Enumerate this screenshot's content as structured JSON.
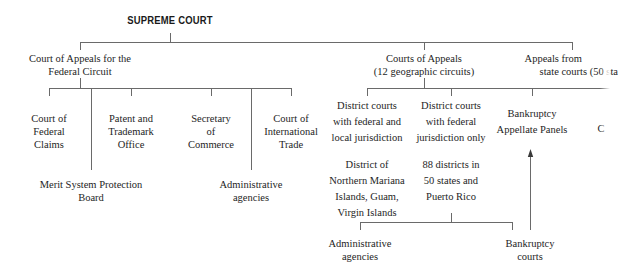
{
  "diagram": {
    "root": {
      "label": "SUPREME COURT"
    },
    "level1": [
      {
        "id": "cafc",
        "lines": [
          "Court of Appeals for the",
          "Federal Circuit"
        ]
      },
      {
        "id": "coa",
        "lines": [
          "Courts of Appeals",
          "(12 geographic circuits)"
        ]
      },
      {
        "id": "state",
        "lines": [
          "Appeals from",
          "state courts (50 sta"
        ]
      }
    ],
    "cafc_children": [
      {
        "id": "federal-claims",
        "lines": [
          "Court of",
          "Federal",
          "Claims"
        ]
      },
      {
        "id": "patent-trademark",
        "lines": [
          "Patent and",
          "Trademark",
          "Office"
        ]
      },
      {
        "id": "secretary-commerce",
        "lines": [
          "Secretary",
          "of",
          "Commerce"
        ]
      },
      {
        "id": "international-trade",
        "lines": [
          "Court of",
          "International",
          "Trade"
        ]
      },
      {
        "id": "merit-system",
        "lines": [
          "Merit System Protection",
          "Board"
        ]
      },
      {
        "id": "admin-agencies-left",
        "lines": [
          "Administrative",
          "agencies"
        ]
      }
    ],
    "coa_children": [
      {
        "id": "district-federal-local",
        "lines": [
          "District courts",
          "with federal and",
          "local jurisdiction"
        ]
      },
      {
        "id": "district-federal-only",
        "lines": [
          "District courts",
          "with federal",
          "jurisdiction only"
        ]
      },
      {
        "id": "bankruptcy-panels",
        "lines": [
          "Bankruptcy",
          "Appellate Panels"
        ]
      },
      {
        "id": "cut-off",
        "lines": [
          "C"
        ]
      }
    ],
    "district_details": [
      {
        "id": "territories",
        "lines": [
          "District of",
          "Northern Mariana",
          "Islands, Guam,",
          "Virgin Islands"
        ]
      },
      {
        "id": "districts-88",
        "lines": [
          "88 districts in",
          "50 states and",
          "Puerto Rico"
        ]
      }
    ],
    "bottom": [
      {
        "id": "admin-agencies-bottom",
        "lines": [
          "Administrative",
          "agencies"
        ]
      },
      {
        "id": "bankruptcy-courts",
        "lines": [
          "Bankruptcy",
          "courts"
        ]
      }
    ],
    "colors": {
      "line": "#6a6a6a",
      "text": "#1e1e1e",
      "background": "#ffffff"
    }
  }
}
